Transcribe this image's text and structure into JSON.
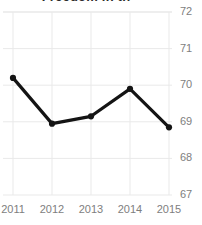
{
  "chart_data": {
    "type": "line",
    "title": "Freedom in th",
    "title_clipped": true,
    "xlabel": "",
    "ylabel": "",
    "categories": [
      "2011",
      "2012",
      "2013",
      "2014",
      "2015"
    ],
    "x": [
      2011,
      2012,
      2013,
      2014,
      2015
    ],
    "values": [
      70.2,
      68.95,
      69.15,
      69.9,
      68.85
    ],
    "series": [
      {
        "name": "Score",
        "values": [
          70.2,
          68.95,
          69.15,
          69.9,
          68.85
        ]
      }
    ],
    "ylim": [
      67,
      72
    ],
    "xlim": [
      2011,
      2015
    ],
    "yticks": [
      67,
      68,
      69,
      70,
      71,
      72
    ],
    "ytick_labels": [
      "67",
      "68",
      "69",
      "70",
      "71",
      "72"
    ],
    "xticks": [
      2011,
      2012,
      2013,
      2014,
      2015
    ],
    "xtick_labels": [
      "2011",
      "2012",
      "2013",
      "2014",
      "2015"
    ],
    "grid": true,
    "grid_axis": "both",
    "legend": false,
    "legend_position": "none",
    "y_axis_side": "right",
    "marker": "circle",
    "line_color": "#141414",
    "marker_color": "#141414",
    "grid_color": "#e9e9e9",
    "tick_label_color": "#7e7e7e",
    "background_color": "#ffffff"
  }
}
